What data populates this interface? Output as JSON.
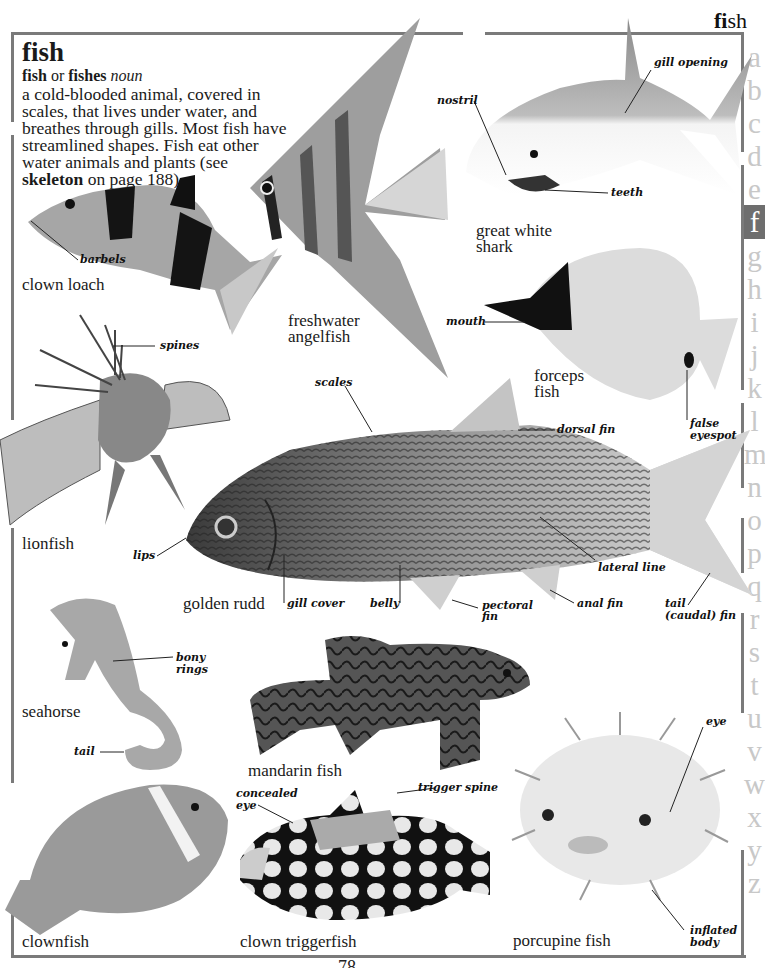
{
  "running_head": {
    "bold": "fi",
    "rest": "sh"
  },
  "entry": {
    "headword": "fish",
    "form_1": "fish",
    "form_or": " or ",
    "form_2": "fishes",
    "part_of_speech": "noun",
    "definition_lines": [
      "a cold-blooded animal, covered in",
      "scales, that lives under water, and",
      "breathes through gills. Most fish have",
      "streamlined shapes. Fish eat other",
      "water animals and plants (see"
    ],
    "crossref_word": "skeleton",
    "crossref_rest": " on page 188)."
  },
  "alphabet": [
    "a",
    "b",
    "c",
    "d",
    "e",
    "f",
    "g",
    "h",
    "i",
    "j",
    "k",
    "l",
    "m",
    "n",
    "o",
    "p",
    "q",
    "r",
    "s",
    "t",
    "u",
    "v",
    "w",
    "x",
    "y",
    "z"
  ],
  "alphabet_active": "f",
  "fish": [
    {
      "id": "clown-loach",
      "caption": [
        "clown loach"
      ],
      "labels": [
        "barbels"
      ]
    },
    {
      "id": "freshwater-angelfish",
      "caption": [
        "freshwater",
        "angelfish"
      ],
      "labels": []
    },
    {
      "id": "great-white-shark",
      "caption": [
        "great white",
        "shark"
      ],
      "labels": [
        "nostril",
        "gill opening",
        "teeth"
      ]
    },
    {
      "id": "forceps-fish",
      "caption": [
        "forceps",
        "fish"
      ],
      "labels": [
        "mouth",
        "false",
        "eyespot"
      ]
    },
    {
      "id": "lionfish",
      "caption": [
        "lionfish"
      ],
      "labels": [
        "spines"
      ]
    },
    {
      "id": "golden-rudd",
      "caption": [
        "golden rudd"
      ],
      "labels": [
        "scales",
        "dorsal fin",
        "lips",
        "lateral line",
        "gill cover",
        "belly",
        "pectoral",
        "fin",
        "anal fin",
        "tail",
        "(caudal) fin"
      ]
    },
    {
      "id": "seahorse",
      "caption": [
        "seahorse"
      ],
      "labels": [
        "bony",
        "rings",
        "tail"
      ]
    },
    {
      "id": "mandarin-fish",
      "caption": [
        "mandarin fish"
      ],
      "labels": []
    },
    {
      "id": "clownfish",
      "caption": [
        "clownfish"
      ],
      "labels": []
    },
    {
      "id": "clown-triggerfish",
      "caption": [
        "clown triggerfish"
      ],
      "labels": [
        "concealed",
        "eye",
        "trigger spine"
      ]
    },
    {
      "id": "porcupine-fish",
      "caption": [
        "porcupine fish"
      ],
      "labels": [
        "eye",
        "inflated",
        "body"
      ]
    }
  ],
  "page_number": "78",
  "colors": {
    "frame": "#7a7a7a",
    "alpha_inactive": "#c8c8c8",
    "alpha_active_bg": "#6e6e6e"
  }
}
